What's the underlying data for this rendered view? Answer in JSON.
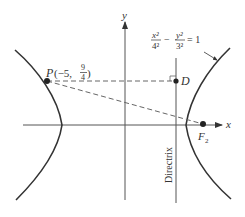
{
  "diagram": {
    "type": "hyperbola-directrix",
    "equation": {
      "x_num": "x²",
      "x_den": "4²",
      "minus": "−",
      "y_num": "y²",
      "y_den": "3²",
      "rhs": "= 1"
    },
    "axes": {
      "x_label": "x",
      "y_label": "y"
    },
    "points": {
      "P": {
        "name": "P",
        "coords_prefix": "(−5, ",
        "frac_num": "9",
        "frac_den": "4",
        "coords_suffix": ")"
      },
      "D": {
        "name": "D"
      },
      "F2": {
        "name": "F",
        "subscript": "2"
      }
    },
    "directrix_label": "Directrix",
    "colors": {
      "curve": "#333333",
      "axis": "#555555",
      "dashed": "#666666",
      "text": "#333333"
    }
  }
}
